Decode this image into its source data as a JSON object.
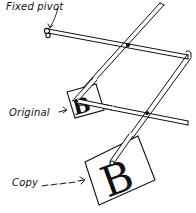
{
  "figure": {
    "type": "pantograph-diagram",
    "labels": {
      "fixed_pivot": "Fixed pivot",
      "original": "Original",
      "copy": "Copy"
    },
    "glyphs": {
      "original_letter": "B",
      "copy_letter": "B"
    },
    "colors": {
      "ink": "#111111",
      "background": "#ffffff"
    }
  }
}
